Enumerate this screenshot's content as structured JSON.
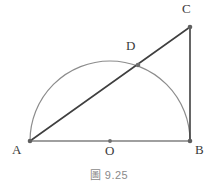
{
  "figure": {
    "caption_symbol": "圖",
    "caption_number": "9.25",
    "caption_full": "圖 9.25"
  },
  "geometry": {
    "description": "Right triangle ABC with semicircle on diameter AB meeting hypotenuse AC at D",
    "canvas": {
      "width": 218,
      "height": 192
    },
    "points": [
      {
        "id": "A",
        "label": "A",
        "x": 30,
        "y": 141
      },
      {
        "id": "B",
        "label": "B",
        "x": 190,
        "y": 141
      },
      {
        "id": "C",
        "label": "C",
        "x": 190,
        "y": 27
      },
      {
        "id": "D",
        "label": "D",
        "x": 138,
        "y": 65
      },
      {
        "id": "O",
        "label": "O",
        "x": 110,
        "y": 141
      }
    ],
    "segments": [
      {
        "id": "AB",
        "from": "A",
        "to": "B",
        "color": "#808080",
        "width": 1.6
      },
      {
        "id": "BC",
        "from": "B",
        "to": "C",
        "color": "#3f3f3f",
        "width": 1.6
      },
      {
        "id": "AC",
        "from": "A",
        "to": "C",
        "color": "#3f3f3f",
        "width": 1.6
      }
    ],
    "arc": {
      "id": "semicircle-AB",
      "center_x": 110,
      "center_y": 141,
      "radius": 80,
      "start_x": 30,
      "start_y": 141,
      "end_x": 190,
      "end_y": 141,
      "color": "#8c8c8c",
      "width": 1.2
    },
    "dot_color": "#6e6e6e",
    "dot_radius": 2
  },
  "colors": {
    "background": "#ffffff",
    "line_dark": "#3f3f3f",
    "line_gray": "#808080",
    "arc_gray": "#8c8c8c",
    "label_text": "#3a3a3a",
    "caption_text": "#8a8a8a"
  }
}
